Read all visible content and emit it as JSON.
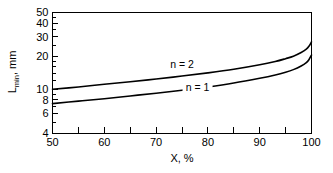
{
  "chart_data": {
    "type": "line",
    "title": "",
    "xlabel": "X, %",
    "ylabel": "L_min, mm",
    "ylabel_main": "L",
    "ylabel_sub": "min",
    "ylabel_unit": ", mm",
    "xlim": [
      50,
      100
    ],
    "ylim": [
      4,
      50
    ],
    "yscale": "log",
    "xscale": "linear",
    "grid": false,
    "legend": "inline-annotations",
    "xticks": [
      50,
      60,
      70,
      80,
      90,
      100
    ],
    "xticklabels": [
      "50",
      "60",
      "70",
      "80",
      "90",
      "100"
    ],
    "xminorticks": [
      55,
      65,
      75,
      85,
      95
    ],
    "yticks": [
      4,
      6,
      8,
      10,
      20,
      30,
      40,
      50
    ],
    "yticklabels": [
      "4",
      "6",
      "8",
      "10",
      "20",
      "30",
      "40",
      "50"
    ],
    "yminorticks": [
      5,
      7,
      9,
      12,
      14,
      16,
      18,
      25,
      35,
      45
    ],
    "series": [
      {
        "name": "n = 2",
        "label": "n = 2",
        "label_x": 75,
        "label_y": 15.6,
        "x": [
          50,
          55,
          60,
          65,
          70,
          75,
          80,
          85,
          90,
          93,
          95,
          96.5,
          98,
          99,
          99.5,
          100
        ],
        "y": [
          10.0,
          10.5,
          11.1,
          11.7,
          12.4,
          13.2,
          14.1,
          15.2,
          16.7,
          17.9,
          19.0,
          20.0,
          21.6,
          23.2,
          24.6,
          27.0
        ]
      },
      {
        "name": "n = 1",
        "label": "n = 1",
        "label_x": 78,
        "label_y": 9.7,
        "x": [
          50,
          55,
          60,
          65,
          70,
          75,
          80,
          85,
          90,
          93,
          95,
          96.5,
          98,
          99,
          99.5,
          100
        ],
        "y": [
          7.4,
          7.8,
          8.2,
          8.7,
          9.2,
          9.8,
          10.5,
          11.4,
          12.6,
          13.5,
          14.3,
          15.1,
          16.3,
          17.5,
          18.6,
          20.5
        ]
      }
    ]
  },
  "axes": {
    "x_axis_title": "X, %",
    "y_axis_title_main": "L",
    "y_axis_title_sub": "min",
    "y_axis_title_unit": ", mm"
  },
  "colors": {
    "curve": "#000000",
    "axis": "#000000",
    "background": "#ffffff",
    "text": "#000000"
  }
}
